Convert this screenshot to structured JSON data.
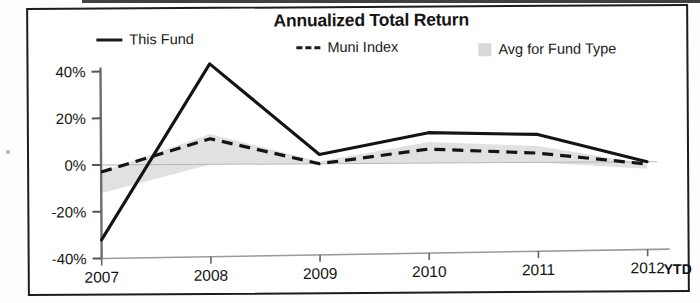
{
  "chart_data": {
    "type": "line",
    "title": "Annualized Total Return",
    "xlabel": "",
    "ylabel": "",
    "categories": [
      "2007",
      "2008",
      "2009",
      "2010",
      "2011",
      "2012"
    ],
    "x_axis_note": "YTD",
    "ylim": [
      -40,
      40
    ],
    "ytick_labels": [
      "40%",
      "20%",
      "0%",
      "-20%",
      "-40%"
    ],
    "ytick_values": [
      40,
      20,
      0,
      -20,
      -40
    ],
    "grid": false,
    "legend_position": "top",
    "series": [
      {
        "name": "This Fund",
        "style": "solid",
        "color": "#1b1b1b",
        "values": [
          -32,
          43,
          4,
          13,
          12,
          0
        ]
      },
      {
        "name": "Muni Index",
        "style": "dashed",
        "color": "#1b1b1b",
        "values": [
          -3,
          11,
          0,
          6,
          4,
          -1
        ]
      },
      {
        "name": "Avg for Fund Type",
        "style": "shaded-band",
        "color": "#d9d9d9",
        "values": [
          -12,
          13,
          1,
          9,
          7,
          -3
        ]
      }
    ]
  },
  "chart": {
    "title": "Annualized Total Return",
    "legend": [
      {
        "label": "This Fund",
        "swatch": "solid-line-swatch"
      },
      {
        "label": "Muni Index",
        "swatch": "dashed-line-swatch"
      },
      {
        "label": "Avg for Fund Type",
        "swatch": "gray-band-swatch"
      }
    ],
    "y_ticks": [
      "40%",
      "20%",
      "0%",
      "-20%",
      "-40%"
    ],
    "x_ticks": [
      "2007",
      "2008",
      "2009",
      "2010",
      "2011",
      "2012"
    ],
    "x_suffix": "YTD"
  }
}
